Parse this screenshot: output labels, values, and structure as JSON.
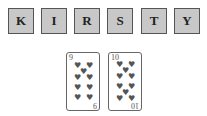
{
  "tiles": [
    {
      "letter": "K"
    },
    {
      "letter": "I"
    },
    {
      "letter": "R"
    },
    {
      "letter": "S"
    },
    {
      "letter": "T"
    },
    {
      "letter": "Y"
    }
  ],
  "cards": [
    {
      "rank": "9",
      "suit": "hearts",
      "suit_glyph": "♥"
    },
    {
      "rank": "10",
      "suit": "hearts",
      "suit_glyph": "♥"
    }
  ],
  "colors": {
    "tile_bg": "#c8c8c8",
    "tile_border": "#555555",
    "pip": "#555555"
  }
}
